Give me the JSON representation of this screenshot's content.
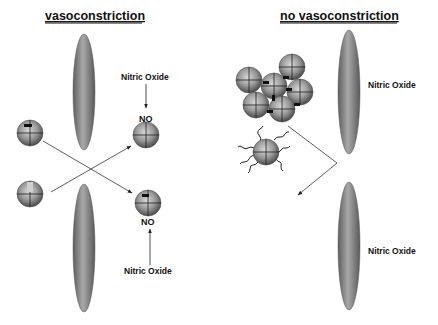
{
  "panels": {
    "left": {
      "title": "vasoconstriction",
      "labels": {
        "top_nitric_oxide": "Nitric Oxide",
        "top_no": "NO",
        "bottom_no": "NO",
        "bottom_nitric_oxide": "Nitric Oxide"
      }
    },
    "right": {
      "title": "no vasoconstriction",
      "labels": {
        "top_nitric_oxide": "Nitric Oxide",
        "bottom_nitric_oxide": "Nitric Oxide"
      }
    }
  }
}
